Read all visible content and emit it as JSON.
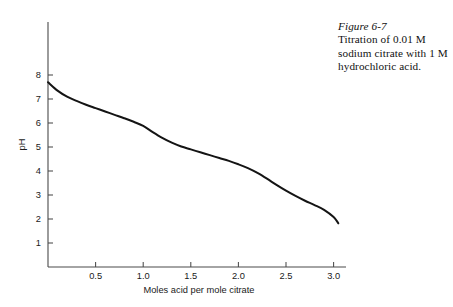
{
  "caption": {
    "figure_number": "Figure 6-7",
    "text": "Titration of 0.01 M sodium citrate with 1 M hydrochloric acid."
  },
  "chart_data": {
    "type": "line",
    "title": "",
    "xlabel": "Moles acid per mole citrate",
    "ylabel": "pH",
    "xlim": [
      0,
      3.15
    ],
    "ylim": [
      0,
      8.6
    ],
    "grid": false,
    "legend": null,
    "xticks": [
      0.5,
      1.0,
      1.5,
      2.0,
      2.5,
      3.0
    ],
    "xtick_labels": [
      "0.5",
      "1.0",
      "1.5",
      "2.0",
      "2.5",
      "3.0"
    ],
    "yticks": [
      1,
      2,
      3,
      4,
      5,
      6,
      7,
      8
    ],
    "ytick_labels": [
      "1",
      "2",
      "3",
      "4",
      "5",
      "6",
      "7",
      "8"
    ],
    "series": [
      {
        "name": "Titration curve",
        "color": "#141414",
        "x": [
          0.0,
          0.1,
          0.2,
          0.3,
          0.4,
          0.5,
          0.6,
          0.7,
          0.8,
          0.9,
          1.0,
          1.1,
          1.2,
          1.3,
          1.4,
          1.5,
          1.6,
          1.7,
          1.8,
          1.9,
          2.0,
          2.1,
          2.2,
          2.3,
          2.4,
          2.5,
          2.6,
          2.7,
          2.8,
          2.9,
          3.0,
          3.05
        ],
        "y": [
          7.7,
          7.35,
          7.1,
          6.92,
          6.76,
          6.62,
          6.48,
          6.34,
          6.2,
          6.05,
          5.88,
          5.62,
          5.38,
          5.18,
          5.02,
          4.9,
          4.78,
          4.66,
          4.54,
          4.42,
          4.28,
          4.12,
          3.92,
          3.68,
          3.42,
          3.18,
          2.96,
          2.76,
          2.58,
          2.38,
          2.08,
          1.82
        ]
      }
    ]
  },
  "axes_geometry": {
    "origin_x": 48,
    "origin_y": 267,
    "y_axis_top": 22,
    "x_axis_right": 346,
    "px_per_x_unit": 95.2,
    "px_per_y_unit": 24.0,
    "tick_length": 5
  }
}
